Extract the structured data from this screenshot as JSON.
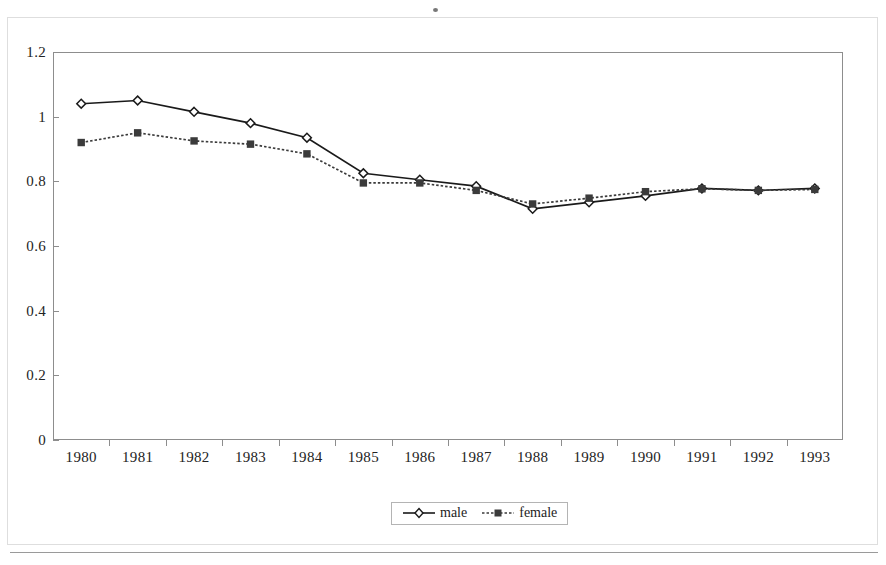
{
  "chart_data": {
    "type": "line",
    "title": "",
    "subtitle": "",
    "xlabel": "",
    "ylabel": "",
    "categories": [
      "1980",
      "1981",
      "1982",
      "1983",
      "1984",
      "1985",
      "1986",
      "1987",
      "1988",
      "1989",
      "1990",
      "1991",
      "1992",
      "1993"
    ],
    "ylim": [
      0,
      1.2
    ],
    "ytick_values": [
      0,
      0.2,
      0.4,
      0.6,
      0.8,
      1,
      1.2
    ],
    "ytick_labels": [
      "0",
      "0.2",
      "0.4",
      "0.6",
      "0.8",
      "1",
      "1.2"
    ],
    "grid": false,
    "legend_position": "bottom-center",
    "series": [
      {
        "name": "male",
        "marker": "open-diamond",
        "line_style": "solid",
        "color": "#1a1a1a",
        "values": [
          1.04,
          1.05,
          1.015,
          0.98,
          0.935,
          0.825,
          0.805,
          0.785,
          0.715,
          0.735,
          0.755,
          0.778,
          0.772,
          0.778
        ]
      },
      {
        "name": "female",
        "marker": "filled-square",
        "line_style": "dotted",
        "color": "#3b3b3b",
        "values": [
          0.92,
          0.95,
          0.925,
          0.915,
          0.885,
          0.795,
          0.795,
          0.772,
          0.73,
          0.748,
          0.768,
          0.777,
          0.772,
          0.775
        ]
      }
    ]
  },
  "legend": {
    "entries": [
      {
        "label": "male"
      },
      {
        "label": "female"
      }
    ]
  },
  "colors": {
    "male_series": "#1a1a1a",
    "female_series": "#3b3b3b",
    "axis": "#8d8d8d",
    "text": "#232323",
    "background": "#ffffff"
  }
}
